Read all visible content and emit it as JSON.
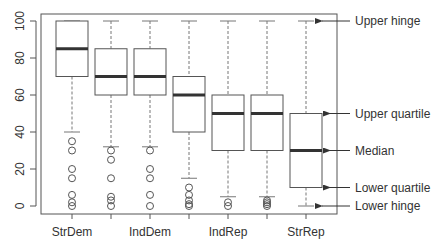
{
  "chart_data": {
    "type": "boxplot",
    "title": "",
    "xlabel": "",
    "ylabel": "",
    "ylim": [
      0,
      100
    ],
    "yticks": [
      0,
      20,
      40,
      60,
      80,
      100
    ],
    "grid": false,
    "categories": [
      "StrDem",
      "WeakDem",
      "IndDem",
      "Ind",
      "IndRep",
      "WeakRep",
      "StrRep"
    ],
    "x_tick_labels_shown": [
      "StrDem",
      "",
      "IndDem",
      "",
      "IndRep",
      "",
      "StrRep"
    ],
    "boxes": [
      {
        "name": "StrDem",
        "lower_hinge": 40,
        "lower_quartile": 70,
        "median": 85,
        "upper_quartile": 100,
        "upper_hinge": 100,
        "outliers": [
          35,
          30,
          20,
          15,
          6,
          2,
          0
        ]
      },
      {
        "name": "WeakDem",
        "lower_hinge": 32,
        "lower_quartile": 60,
        "median": 70,
        "upper_quartile": 85,
        "upper_hinge": 100,
        "outliers": [
          30,
          25,
          15,
          5,
          3,
          0
        ]
      },
      {
        "name": "IndDem",
        "lower_hinge": 32,
        "lower_quartile": 60,
        "median": 70,
        "upper_quartile": 85,
        "upper_hinge": 100,
        "outliers": [
          30,
          20,
          15,
          6,
          0
        ]
      },
      {
        "name": "Ind",
        "lower_hinge": 15,
        "lower_quartile": 40,
        "median": 60,
        "upper_quartile": 70,
        "upper_hinge": 100,
        "outliers": [
          10,
          6,
          3,
          1,
          0
        ]
      },
      {
        "name": "IndRep",
        "lower_hinge": 5,
        "lower_quartile": 30,
        "median": 50,
        "upper_quartile": 60,
        "upper_hinge": 100,
        "outliers": [
          2,
          0
        ]
      },
      {
        "name": "WeakRep",
        "lower_hinge": 5,
        "lower_quartile": 30,
        "median": 50,
        "upper_quartile": 60,
        "upper_hinge": 100,
        "outliers": [
          3,
          2,
          1,
          0
        ]
      },
      {
        "name": "StrRep",
        "lower_hinge": 0,
        "lower_quartile": 10,
        "median": 30,
        "upper_quartile": 50,
        "upper_hinge": 100,
        "outliers": []
      }
    ],
    "annotations": [
      {
        "label": "Upper hinge",
        "target_value": 100
      },
      {
        "label": "Upper quartile",
        "target_value": 50
      },
      {
        "label": "Median",
        "target_value": 30
      },
      {
        "label": "Lower quartile",
        "target_value": 10
      },
      {
        "label": "Lower hinge",
        "target_value": 0
      }
    ],
    "colors": {
      "box_stroke": "#555555",
      "median": "#333333",
      "whisker": "#777777",
      "outlier": "#555555",
      "axis": "#555555",
      "text": "#333333"
    }
  }
}
